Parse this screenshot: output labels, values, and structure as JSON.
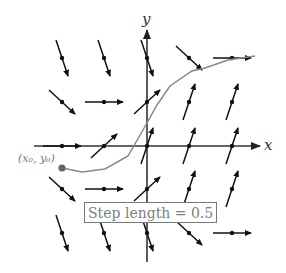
{
  "figure": {
    "x_axis_label": "x",
    "y_axis_label": "y",
    "start_point_label": "(x₀, y₀)",
    "step_label": "Step length  = 0.5",
    "colors": {
      "arrows": "#111111",
      "axes": "#333333",
      "curve": "#888888",
      "start_point": "#666666",
      "label_text": "#808080"
    },
    "grid": {
      "columns_px": [
        62,
        104,
        147,
        189,
        232
      ],
      "rows_px": [
        58,
        102,
        146,
        189,
        233
      ],
      "arrows": [
        {
          "row": 0,
          "col": 0,
          "dir": "down-steep"
        },
        {
          "row": 0,
          "col": 1,
          "dir": "down-steep"
        },
        {
          "row": 0,
          "col": 2,
          "dir": "down-steep"
        },
        {
          "row": 0,
          "col": 3,
          "dir": "down-diagonal"
        },
        {
          "row": 0,
          "col": 4,
          "dir": "flat"
        },
        {
          "row": 1,
          "col": 0,
          "dir": "down-diagonal"
        },
        {
          "row": 1,
          "col": 1,
          "dir": "flat"
        },
        {
          "row": 1,
          "col": 2,
          "dir": "up-diagonal"
        },
        {
          "row": 1,
          "col": 3,
          "dir": "up-steep"
        },
        {
          "row": 1,
          "col": 4,
          "dir": "up-steep"
        },
        {
          "row": 2,
          "col": 0,
          "dir": "flat"
        },
        {
          "row": 2,
          "col": 1,
          "dir": "up-diagonal"
        },
        {
          "row": 2,
          "col": 2,
          "dir": "up-steep"
        },
        {
          "row": 2,
          "col": 3,
          "dir": "up-steep"
        },
        {
          "row": 2,
          "col": 4,
          "dir": "up-steep"
        },
        {
          "row": 3,
          "col": 0,
          "dir": "down-diagonal"
        },
        {
          "row": 3,
          "col": 1,
          "dir": "flat"
        },
        {
          "row": 3,
          "col": 2,
          "dir": "up-diagonal"
        },
        {
          "row": 3,
          "col": 3,
          "dir": "up-steep"
        },
        {
          "row": 3,
          "col": 4,
          "dir": "up-steep"
        },
        {
          "row": 4,
          "col": 0,
          "dir": "down-steep"
        },
        {
          "row": 4,
          "col": 1,
          "dir": "down-steep"
        },
        {
          "row": 4,
          "col": 2,
          "dir": "down-steep"
        },
        {
          "row": 4,
          "col": 3,
          "dir": "down-diagonal"
        },
        {
          "row": 4,
          "col": 4,
          "dir": "flat"
        }
      ]
    },
    "euler_path_px": [
      [
        62,
        168
      ],
      [
        82,
        172
      ],
      [
        105,
        169
      ],
      [
        128,
        156
      ],
      [
        147,
        123
      ],
      [
        157,
        105
      ],
      [
        170,
        86
      ],
      [
        192,
        71
      ],
      [
        205,
        68
      ],
      [
        228,
        60
      ],
      [
        255,
        56
      ]
    ]
  }
}
